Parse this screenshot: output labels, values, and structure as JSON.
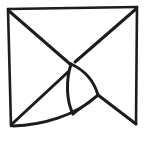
{
  "figure": {
    "title": "Abstract line-art square with converging diagonals and curved sail",
    "kind": "line-drawing",
    "background_color": "#ffffff",
    "stroke_color": "#1c1c1c",
    "canvas": {
      "width": 144,
      "height": 142
    }
  },
  "diagram_data": {
    "type": "line-art",
    "description": "Hand-drawn square frame with diagonal lines from each corner converging toward the centre, a curved sail-like fin in the lower middle, and a swept curved lower-left edge.",
    "elements": [
      {
        "id": "frame-top",
        "name": "frame-top-edge",
        "shape": "line",
        "points": [
          [
            8,
            9
          ],
          [
            137,
            7
          ]
        ]
      },
      {
        "id": "frame-left",
        "name": "frame-left-edge",
        "shape": "line",
        "points": [
          [
            8,
            9
          ],
          [
            11,
            126
          ]
        ]
      },
      {
        "id": "frame-right",
        "name": "frame-right-edge",
        "shape": "line",
        "points": [
          [
            137,
            7
          ],
          [
            136,
            124
          ]
        ]
      },
      {
        "id": "diag-top-left",
        "name": "diagonal-top-left",
        "shape": "line",
        "points": [
          [
            9,
            11
          ],
          [
            70,
            64
          ]
        ]
      },
      {
        "id": "diag-top-right",
        "name": "diagonal-top-right",
        "shape": "line",
        "points": [
          [
            136,
            9
          ],
          [
            75,
            62
          ]
        ]
      },
      {
        "id": "diag-bottom-left",
        "name": "diagonal-bottom-left",
        "shape": "line",
        "points": [
          [
            12,
            124
          ],
          [
            68,
            72
          ]
        ]
      },
      {
        "id": "diag-bottom-right",
        "name": "diagonal-bottom-right",
        "shape": "line",
        "points": [
          [
            136,
            124
          ],
          [
            98,
            95
          ]
        ]
      },
      {
        "id": "sail-spine",
        "name": "sail-spine-curve",
        "shape": "curve",
        "points": [
          [
            71,
            64
          ],
          [
            68,
            92
          ],
          [
            73,
            114
          ]
        ]
      },
      {
        "id": "sail-edge",
        "name": "sail-outer-curve",
        "shape": "curve",
        "points": [
          [
            71,
            64
          ],
          [
            92,
            80
          ],
          [
            98,
            95
          ]
        ]
      },
      {
        "id": "sail-base",
        "name": "sail-base-line",
        "shape": "line",
        "points": [
          [
            73,
            114
          ],
          [
            98,
            95
          ]
        ]
      },
      {
        "id": "bottom-sweep",
        "name": "bottom-sweep-curve",
        "shape": "curve",
        "points": [
          [
            13,
            126
          ],
          [
            55,
            120
          ],
          [
            97,
            96
          ]
        ]
      },
      {
        "id": "junction",
        "name": "three-way-junction",
        "shape": "node",
        "points": [
          [
            97,
            95
          ]
        ]
      }
    ],
    "junctions": [
      {
        "name": "centre-convergence",
        "x": 71,
        "y": 64
      },
      {
        "name": "right-junction",
        "x": 97,
        "y": 95
      },
      {
        "name": "lower-left-corner",
        "x": 12,
        "y": 125
      }
    ],
    "stroke_widths": {
      "frame": 2.6,
      "diagonal": 3.0,
      "curve": 3.0
    }
  }
}
